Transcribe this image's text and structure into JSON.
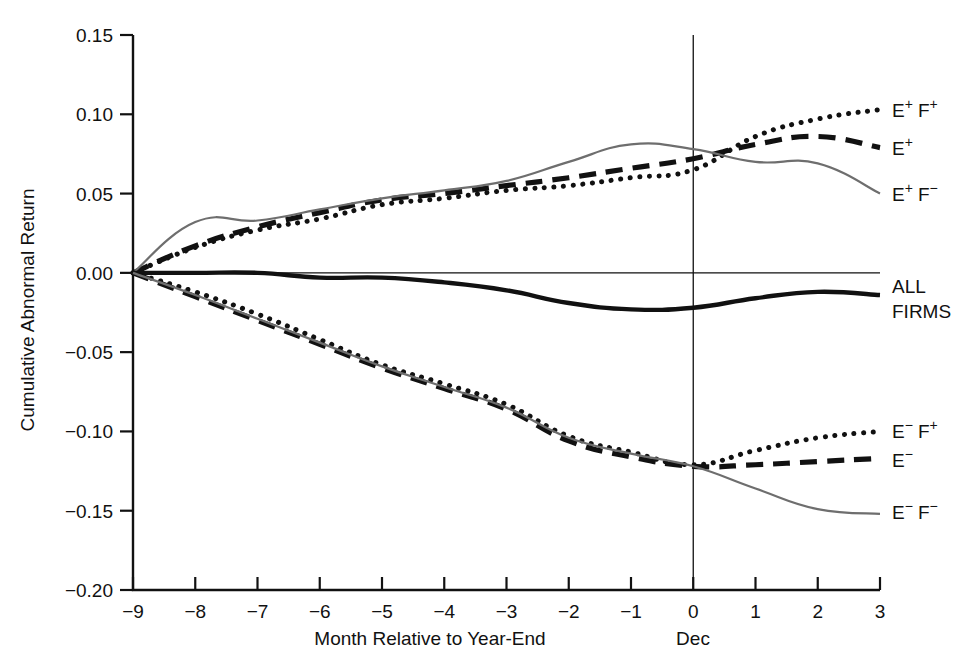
{
  "chart_data": {
    "type": "line",
    "title": "",
    "xlabel": "Month Relative to Year-End",
    "ylabel": "Cumulative Abnormal Return",
    "x": [
      -9,
      -8,
      -7,
      -6,
      -5,
      -4,
      -3,
      -2,
      -1,
      0,
      1,
      2,
      3
    ],
    "xtick_labels": [
      "−9",
      "−8",
      "−7",
      "−6",
      "−5",
      "−4",
      "−3",
      "−2",
      "−1",
      "0",
      "1",
      "2",
      "3"
    ],
    "ytick_labels": [
      "0.15",
      "0.10",
      "0.05",
      "0.00",
      "−0.05",
      "−0.10",
      "−0.15",
      "−0.20"
    ],
    "ytick_values": [
      0.15,
      0.1,
      0.05,
      0.0,
      -0.05,
      -0.1,
      -0.15,
      -0.2
    ],
    "xlim": [
      -9,
      3
    ],
    "ylim": [
      -0.2,
      0.15
    ],
    "grid": false,
    "legend_position": "right-inline",
    "zero_reference_line": true,
    "vertical_marker": {
      "x": 0,
      "label": "Dec"
    },
    "series": [
      {
        "name": "E+ F+",
        "label_main": "E",
        "label_sup1": "+",
        "label_main2": "F",
        "label_sup2": "+",
        "style": "dotted",
        "color": "#111111",
        "label_y": 0.103,
        "values": [
          0.0,
          0.016,
          0.027,
          0.034,
          0.043,
          0.047,
          0.052,
          0.055,
          0.06,
          0.065,
          0.086,
          0.097,
          0.103
        ]
      },
      {
        "name": "E+",
        "label_main": "E",
        "label_sup1": "+",
        "label_main2": "",
        "label_sup2": "",
        "style": "dashed",
        "color": "#111111",
        "label_y": 0.079,
        "values": [
          0.0,
          0.017,
          0.029,
          0.038,
          0.046,
          0.05,
          0.055,
          0.06,
          0.066,
          0.072,
          0.081,
          0.086,
          0.079
        ]
      },
      {
        "name": "E+ F-",
        "label_main": "E",
        "label_sup1": "+",
        "label_main2": "F",
        "label_sup2": "−",
        "style": "thin-gray",
        "color": "#6e6e6e",
        "label_y": 0.05,
        "values": [
          0.0,
          0.032,
          0.033,
          0.04,
          0.047,
          0.052,
          0.058,
          0.07,
          0.081,
          0.078,
          0.07,
          0.069,
          0.05
        ]
      },
      {
        "name": "ALL FIRMS",
        "label_main": "ALL",
        "label_sup1": "",
        "label_main2": "FIRMS",
        "label_sup2": "",
        "style": "solid-thick",
        "color": "#111111",
        "label_y": -0.009,
        "values": [
          0.0,
          0.0,
          0.0,
          -0.003,
          -0.003,
          -0.006,
          -0.011,
          -0.019,
          -0.023,
          -0.022,
          -0.016,
          -0.012,
          -0.014
        ]
      },
      {
        "name": "E- F+",
        "label_main": "E",
        "label_sup1": "−",
        "label_main2": "F",
        "label_sup2": "+",
        "style": "dotted",
        "color": "#111111",
        "label_y": -0.1,
        "values": [
          0.0,
          -0.012,
          -0.026,
          -0.042,
          -0.058,
          -0.07,
          -0.083,
          -0.103,
          -0.113,
          -0.121,
          -0.112,
          -0.104,
          -0.1
        ]
      },
      {
        "name": "E-",
        "label_main": "E",
        "label_sup1": "−",
        "label_main2": "",
        "label_sup2": "",
        "style": "dashed",
        "color": "#111111",
        "label_y": -0.118,
        "values": [
          0.0,
          -0.015,
          -0.03,
          -0.045,
          -0.06,
          -0.073,
          -0.086,
          -0.106,
          -0.116,
          -0.122,
          -0.121,
          -0.119,
          -0.117
        ]
      },
      {
        "name": "E- F-",
        "label_main": "E",
        "label_sup1": "−",
        "label_main2": "F",
        "label_sup2": "−",
        "style": "thin-gray",
        "color": "#6e6e6e",
        "label_y": -0.151,
        "values": [
          0.0,
          -0.014,
          -0.029,
          -0.044,
          -0.059,
          -0.072,
          -0.085,
          -0.104,
          -0.114,
          -0.122,
          -0.136,
          -0.149,
          -0.152
        ]
      }
    ]
  },
  "axes": {
    "y_axis_title": "Cumulative Abnormal Return",
    "x_axis_title": "Month Relative to Year-End",
    "dec_label": "Dec"
  }
}
